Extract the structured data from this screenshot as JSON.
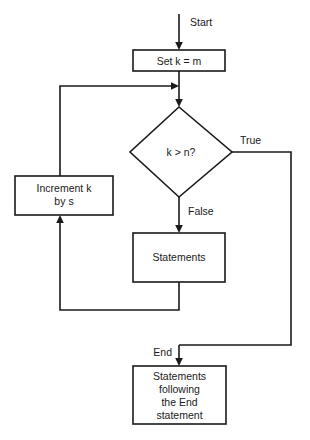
{
  "diagram": {
    "stroke_color": "#1a1a1a",
    "fill_color": "#ffffff",
    "nodes": {
      "init": {
        "shape": "process",
        "text_plain": "Set  k = m",
        "parts": [
          {
            "text": "Set ",
            "italic": false
          },
          {
            "text": "k",
            "italic": true
          },
          {
            "text": " = ",
            "italic": false
          },
          {
            "text": "m",
            "italic": true
          }
        ]
      },
      "decision": {
        "shape": "decision",
        "text_plain": "k > n?",
        "parts": [
          {
            "text": "k",
            "italic": true
          },
          {
            "text": " > ",
            "italic": false
          },
          {
            "text": "n",
            "italic": true
          },
          {
            "text": "?",
            "italic": false
          }
        ]
      },
      "increment": {
        "shape": "process",
        "text_plain": "Increment k by s",
        "line1_parts": [
          {
            "text": "Increment ",
            "italic": false
          },
          {
            "text": "k",
            "italic": true
          }
        ],
        "line2_parts": [
          {
            "text": "by ",
            "italic": false
          },
          {
            "text": "s",
            "italic": true
          }
        ]
      },
      "body": {
        "shape": "process",
        "text_plain": "Statements",
        "lines": [
          "Statements"
        ]
      },
      "after": {
        "shape": "process",
        "text_plain": "Statements following the End statement",
        "lines": [
          "Statements",
          "following",
          "the End",
          "statement"
        ]
      }
    },
    "edge_labels": {
      "start": "Start",
      "true": "True",
      "false": "False",
      "end": "End"
    }
  }
}
